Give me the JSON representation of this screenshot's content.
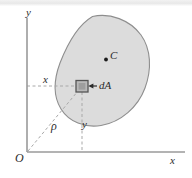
{
  "figure": {
    "width": 192,
    "height": 178,
    "background_color": "#ffffff",
    "top_band_color": "#ebebeb"
  },
  "axes": {
    "y_axis_label": "y",
    "x_axis_label": "x",
    "origin_label": "O",
    "axis_color": "#9a9a9a",
    "origin_px": {
      "x": 27,
      "y": 152
    },
    "y_axis_top_px": 18,
    "x_axis_right_px": 185
  },
  "area": {
    "name": "area-blob",
    "fill_color": "#dcdcdc",
    "stroke_color": "#8e8e8e",
    "bounds_px": {
      "left": 57,
      "top": 15,
      "right": 150,
      "bottom": 126
    }
  },
  "centroid": {
    "label": "C",
    "dot_color": "#1c1c1c",
    "position_px": {
      "x": 106,
      "y": 59
    }
  },
  "element": {
    "label": "dA",
    "fill_color": "#b9b9b9",
    "stroke_color": "#555555",
    "position_px": {
      "x": 82,
      "y": 86
    },
    "size_px": 12
  },
  "dimensions": {
    "x_label": "x",
    "y_label": "y",
    "rho_label": "ρ",
    "dashed_color": "#a8a8a8"
  },
  "annotations": {
    "arrow_label": "dA",
    "arrow_color": "#2b2b2b",
    "arrow_from_px": {
      "x": 97,
      "y": 86
    },
    "arrow_to_px": {
      "x": 89,
      "y": 86
    }
  }
}
